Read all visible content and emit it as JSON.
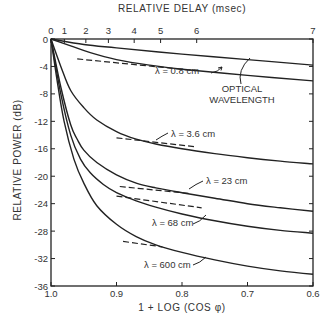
{
  "chart_data": {
    "type": "line",
    "title": "",
    "xlabel": "1 + LOG (COS φ)",
    "ylabel": "RELATIVE POWER (dB)",
    "x2label": "RELATIVE DELAY (msec)",
    "xlim": [
      1.0,
      0.6
    ],
    "ylim": [
      -36,
      0
    ],
    "x_ticks": [
      "1.0",
      "0.9",
      "0.8",
      "0.7",
      "0.6"
    ],
    "y_ticks": [
      "0",
      "-4",
      "-8",
      "-12",
      "-16",
      "-20",
      "-24",
      "-28",
      "-32",
      "-36"
    ],
    "x2_ticks": [
      "0",
      "1",
      "2",
      "3",
      "4",
      "5",
      "6",
      "7"
    ],
    "x2_tick_positions": [
      1.0,
      0.9796,
      0.9468,
      0.9124,
      0.873,
      0.8327,
      0.7776,
      0.6
    ],
    "grid": false,
    "series": [
      {
        "name": "OPTICAL WAVELENGTH",
        "style": "solid",
        "x": [
          1.0,
          0.95,
          0.9,
          0.8,
          0.7,
          0.6
        ],
        "y": [
          0,
          -0.8,
          -1.3,
          -2.2,
          -3.0,
          -3.8
        ]
      },
      {
        "name": "λ = 0.8 cm",
        "style": "solid",
        "x": [
          1.0,
          0.97,
          0.94,
          0.9,
          0.85,
          0.8,
          0.7,
          0.6
        ],
        "y": [
          0,
          -1.0,
          -2.0,
          -3.0,
          -3.8,
          -4.4,
          -5.3,
          -6.1
        ]
      },
      {
        "name": "λ = 3.6 cm",
        "style": "solid",
        "x": [
          1.0,
          0.985,
          0.97,
          0.95,
          0.93,
          0.9,
          0.87,
          0.84,
          0.8,
          0.75,
          0.7,
          0.65,
          0.6
        ],
        "y": [
          0,
          -4.0,
          -7.5,
          -10.0,
          -11.8,
          -13.5,
          -14.6,
          -15.3,
          -16.0,
          -16.7,
          -17.3,
          -17.8,
          -18.2
        ]
      },
      {
        "name": "λ = 23 cm",
        "style": "solid",
        "x": [
          1.0,
          0.985,
          0.97,
          0.96,
          0.95,
          0.93,
          0.9,
          0.87,
          0.84,
          0.8,
          0.75,
          0.7,
          0.65,
          0.6
        ],
        "y": [
          0,
          -7.0,
          -12.5,
          -14.6,
          -16.2,
          -18.0,
          -19.8,
          -21.0,
          -21.7,
          -22.4,
          -23.2,
          -24.0,
          -24.6,
          -25.1
        ]
      },
      {
        "name": "λ = 68 cm",
        "style": "solid",
        "x": [
          1.0,
          0.985,
          0.97,
          0.955,
          0.94,
          0.92,
          0.9,
          0.87,
          0.84,
          0.8,
          0.75,
          0.7,
          0.65,
          0.6
        ],
        "y": [
          0,
          -8.0,
          -14.0,
          -17.5,
          -19.5,
          -21.2,
          -22.4,
          -23.6,
          -24.5,
          -25.5,
          -26.5,
          -27.3,
          -27.9,
          -28.3
        ]
      },
      {
        "name": "λ = 600 cm",
        "style": "solid",
        "x": [
          1.0,
          0.99,
          0.98,
          0.965,
          0.95,
          0.93,
          0.9,
          0.87,
          0.84,
          0.8,
          0.75,
          0.7,
          0.65,
          0.6
        ],
        "y": [
          0,
          -6.5,
          -12.0,
          -17.5,
          -21.0,
          -24.3,
          -27.0,
          -28.8,
          -30.0,
          -31.1,
          -32.2,
          -33.1,
          -33.8,
          -34.3
        ]
      }
    ],
    "asymptotes": [
      {
        "series": "λ = 0.8 cm",
        "style": "dashed",
        "x": [
          0.96,
          0.78
        ],
        "y": [
          -2.9,
          -4.6
        ]
      },
      {
        "series": "λ = 3.6 cm",
        "style": "dashed",
        "x": [
          0.9,
          0.78
        ],
        "y": [
          -14.4,
          -15.7
        ]
      },
      {
        "series": "λ = 23 cm",
        "style": "dashed",
        "x": [
          0.895,
          0.79
        ],
        "y": [
          -21.5,
          -22.5
        ]
      },
      {
        "series": "λ = 68 cm",
        "style": "dashed",
        "x": [
          0.9,
          0.77
        ],
        "y": [
          -22.9,
          -24.6
        ]
      },
      {
        "series": "λ = 600 cm",
        "style": "dashed",
        "x": [
          0.89,
          0.83
        ],
        "y": [
          -29.5,
          -30.3
        ]
      }
    ],
    "annotations": [
      {
        "text": "λ = 0.8 cm"
      },
      {
        "text": "OPTICAL"
      },
      {
        "text": "WAVELENGTH"
      },
      {
        "text": "λ = 3.6 cm"
      },
      {
        "text": "λ = 23 cm"
      },
      {
        "text": "λ = 68 cm"
      },
      {
        "text": "λ = 600 cm"
      }
    ]
  },
  "labels": {
    "x_title": "1 + LOG (COS φ)",
    "y_title": "RELATIVE POWER (dB)",
    "top_title": "RELATIVE DELAY (msec)",
    "lam08": "λ = 0.8 cm",
    "optical1": "OPTICAL",
    "optical2": "WAVELENGTH",
    "lam36": "λ = 3.6 cm",
    "lam23": "λ = 23 cm",
    "lam68": "λ = 68 cm",
    "lam600": "λ = 600 cm"
  },
  "colors": {
    "ink": "#222222",
    "background": "#ffffff"
  }
}
